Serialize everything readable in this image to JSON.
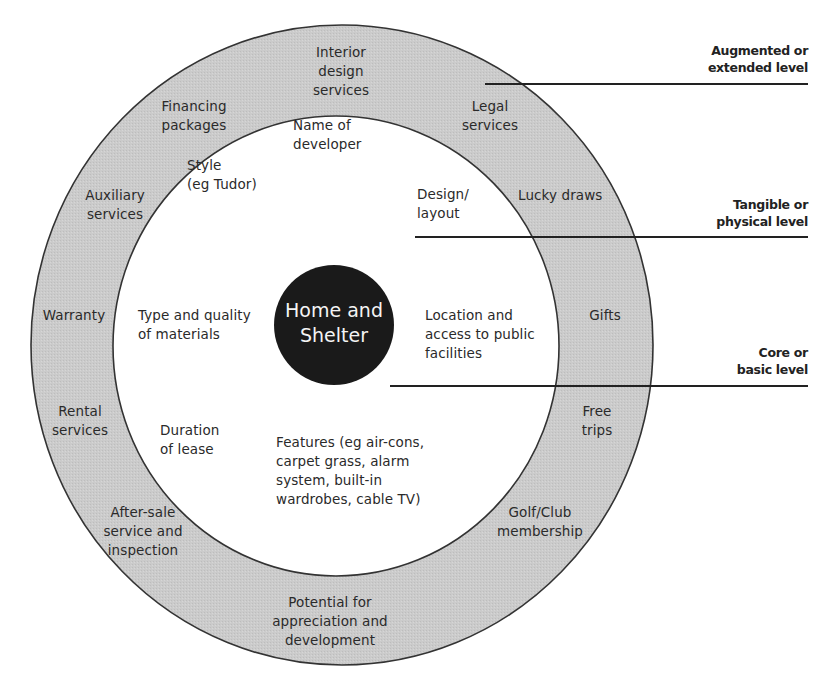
{
  "diagram": {
    "type": "concentric-product-levels",
    "core": {
      "label_line1": "Home and",
      "label_line2": "Shelter"
    },
    "tangible_ring": {
      "items": [
        {
          "id": "name-of-developer",
          "line1": "Name of",
          "line2": "developer"
        },
        {
          "id": "style",
          "line1": "Style",
          "line2": "(eg Tudor)"
        },
        {
          "id": "design-layout",
          "line1": "Design/",
          "line2": "layout"
        },
        {
          "id": "type-quality-materials",
          "line1": "Type and quality",
          "line2": "of materials"
        },
        {
          "id": "location-access",
          "line1": "Location and",
          "line2": "access to public",
          "line3": "facilities"
        },
        {
          "id": "duration-of-lease",
          "line1": "Duration",
          "line2": "of lease"
        },
        {
          "id": "features",
          "line1": "Features (eg air-cons,",
          "line2": "carpet grass, alarm",
          "line3": "system, built-in",
          "line4": "wardrobes, cable TV)"
        }
      ]
    },
    "augmented_ring": {
      "items": [
        {
          "id": "interior-design-services",
          "line1": "Interior",
          "line2": "design",
          "line3": "services"
        },
        {
          "id": "financing-packages",
          "line1": "Financing",
          "line2": "packages"
        },
        {
          "id": "legal-services",
          "line1": "Legal",
          "line2": "services"
        },
        {
          "id": "auxiliary-services",
          "line1": "Auxiliary",
          "line2": "services"
        },
        {
          "id": "lucky-draws",
          "line1": "Lucky draws"
        },
        {
          "id": "warranty",
          "line1": "Warranty"
        },
        {
          "id": "gifts",
          "line1": "Gifts"
        },
        {
          "id": "rental-services",
          "line1": "Rental",
          "line2": "services"
        },
        {
          "id": "free-trips",
          "line1": "Free",
          "line2": "trips"
        },
        {
          "id": "after-sale-service",
          "line1": "After-sale",
          "line2": "service and",
          "line3": "inspection"
        },
        {
          "id": "golf-club-membership",
          "line1": "Golf/Club",
          "line2": "membership"
        },
        {
          "id": "potential-appreciation",
          "line1": "Potential for",
          "line2": "appreciation and",
          "line3": "development"
        }
      ]
    },
    "levels": [
      {
        "id": "augmented",
        "line1": "Augmented or",
        "line2": "extended level"
      },
      {
        "id": "tangible",
        "line1": "Tangible or",
        "line2": "physical level"
      },
      {
        "id": "core",
        "line1": "Core or",
        "line2": "basic level"
      }
    ],
    "colors": {
      "ring_fill": "#c9c9c9",
      "ring_stroke": "#333333",
      "core_fill": "#1a1a1a",
      "core_text": "#f4f4f4",
      "leader_line": "#222222"
    }
  }
}
